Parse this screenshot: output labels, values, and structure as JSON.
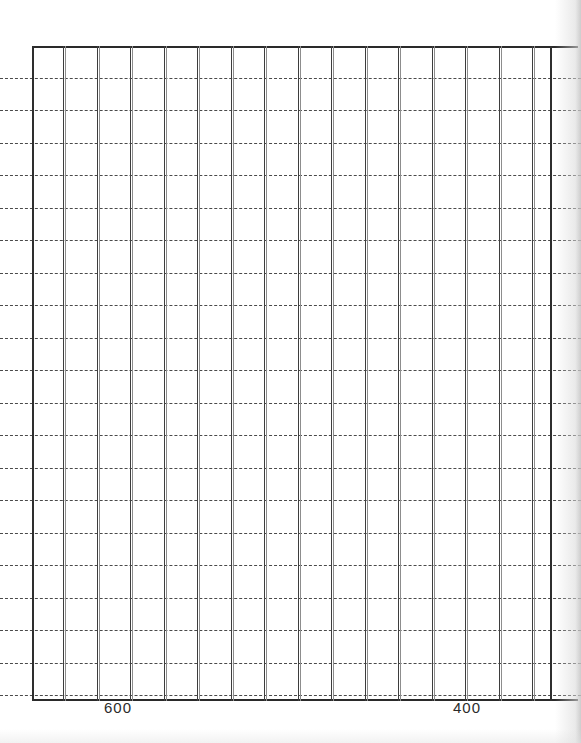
{
  "document": {
    "kind": "scanned-chart-grid",
    "background_color": "#ffffff",
    "ink_color": "#3d3d3d"
  },
  "chart_data": {
    "type": "line",
    "title": "",
    "subtitle": "",
    "xlabel": "",
    "ylabel": "",
    "grid": true,
    "legend": null,
    "series": [],
    "x": [],
    "values": [],
    "x_tick_labels": [
      "600",
      "400"
    ],
    "x_tick_values": [
      600,
      400
    ],
    "x_tick_positions_px": [
      118,
      467
    ],
    "x_axis_direction": "descending",
    "xlim": [
      700,
      300
    ],
    "ylim": [
      0,
      100
    ],
    "y_tick_labels": [],
    "vertical_gridline_count": 17,
    "horizontal_gridline_count": 20,
    "vertical_gridline_style": "solid",
    "horizontal_gridline_style": "dashed",
    "vertical_gridlines_px": [
      32,
      63,
      97,
      130,
      164,
      197,
      231,
      264,
      298,
      331,
      365,
      398,
      432,
      465,
      499,
      532,
      550
    ],
    "horizontal_gridlines_px": [
      78,
      110,
      143,
      175,
      208,
      240,
      273,
      305,
      338,
      370,
      403,
      435,
      468,
      500,
      533,
      565,
      598,
      630,
      663,
      695
    ]
  },
  "plot_frame": {
    "left_px": 32,
    "top_px": 46,
    "width_px": 546,
    "height_px": 655
  },
  "x_axis": {
    "labels": [
      {
        "text": "600",
        "x_px": 118
      },
      {
        "text": "400",
        "x_px": 467
      }
    ]
  }
}
